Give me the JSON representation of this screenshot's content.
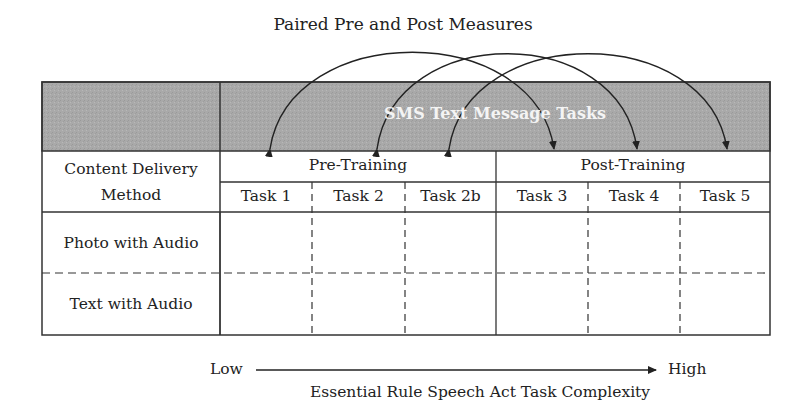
{
  "diagram": {
    "title": "Paired Pre and Post Measures",
    "header_band": "SMS Text Message Tasks",
    "row_header_label": "Content Delivery Method",
    "row_header_line1": "Content Delivery",
    "row_header_line2": "Method",
    "phases": [
      {
        "label": "Pre-Training",
        "tasks": [
          "Task 1",
          "Task 2",
          "Task 2b"
        ]
      },
      {
        "label": "Post-Training",
        "tasks": [
          "Task 3",
          "Task 4",
          "Task 5"
        ]
      }
    ],
    "rows": [
      "Photo with Audio",
      "Text with Audio"
    ],
    "pairings": [
      {
        "from": "Task 1",
        "to": "Task 3"
      },
      {
        "from": "Task 2",
        "to": "Task 4"
      },
      {
        "from": "Task 2b",
        "to": "Task 5"
      }
    ],
    "axis": {
      "low": "Low",
      "high": "High",
      "label": "Essential Rule Speech Act Task Complexity"
    },
    "colors": {
      "header_band": "#a9a9a9",
      "line": "#222222"
    }
  }
}
